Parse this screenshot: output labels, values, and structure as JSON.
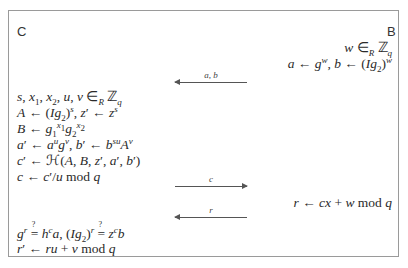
{
  "parties": {
    "left": "C",
    "right": "B"
  },
  "right_steps": {
    "line1": "w ∈R ℤq",
    "line2": "a ← g^w, b ← (Ig2)^w",
    "response": "r ← cx + w mod q"
  },
  "left_steps": [
    "s, x1, x2, u, v ∈R ℤq",
    "A ← (Ig2)^s, z′ ← z^s",
    "B ← g1^x1 g2^x2",
    "a′ ← a^u g^v, b′ ← b^su A^v",
    "c′ ← ℋ(A, B, z′, a′, b′)",
    "c ← c′/u mod q"
  ],
  "verify_steps": [
    "g^r ≟ h^c a, (Ig2)^r ≟ z^c b",
    "r′ ← ru + v mod q"
  ],
  "messages": [
    {
      "label": "a, b",
      "direction": "left"
    },
    {
      "label": "c",
      "direction": "right"
    },
    {
      "label": "r",
      "direction": "left"
    }
  ]
}
